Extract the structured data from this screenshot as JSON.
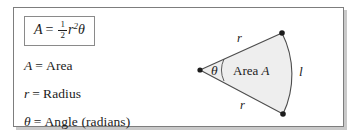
{
  "figure": {
    "type": "geometry-diagram",
    "border_color": "#7d7d7d",
    "sector_fill": "#eeeeee",
    "sector_stroke": "#4d4d4d",
    "text_color": "#1c1c1c"
  },
  "formula": {
    "lhs": "A",
    "equals": "=",
    "fraction_numerator": "1",
    "fraction_denominator": "2",
    "radius_symbol": "r",
    "radius_exponent": "2",
    "angle_symbol": "θ"
  },
  "legend": [
    {
      "symbol": "A",
      "equals": "=",
      "meaning": "Area"
    },
    {
      "symbol": "r",
      "equals": "=",
      "meaning": "Radius"
    },
    {
      "symbol": "θ",
      "equals": "=",
      "meaning": "Angle (radians)"
    }
  ],
  "diagram_labels": {
    "radius_top": "r",
    "radius_bottom": "r",
    "arc_length": "l",
    "angle": "θ",
    "area_text": "Area",
    "area_symbol": "A"
  }
}
